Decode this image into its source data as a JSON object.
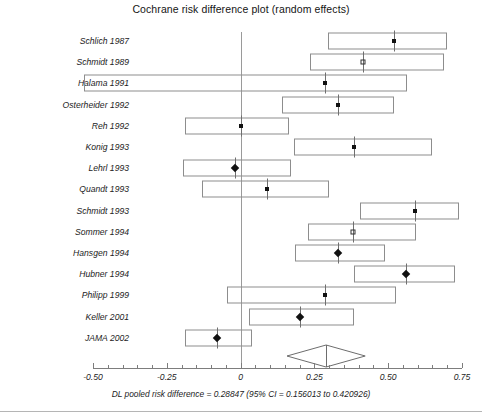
{
  "chart_data": {
    "type": "scatter",
    "subtype": "forest-plot",
    "title": "Cochrane risk difference plot (random effects)",
    "xlabel": "",
    "ylabel": "",
    "xlim": [
      -0.55,
      0.78
    ],
    "grid": false,
    "legend": "none",
    "axis": {
      "tick_labels": [
        "-0.50",
        "-0.25",
        "0",
        "0.25",
        "0.50",
        "0.75"
      ],
      "tick_values": [
        -0.5,
        -0.25,
        0,
        0.25,
        0.5,
        0.75
      ],
      "minor_tick_step": 0.05,
      "reference_line": 0
    },
    "categories": [
      "Schlich 1987",
      "Schmidt 1989",
      "Halama 1991",
      "Osterheider 1992",
      "Reh 1992",
      "Konig 1993",
      "Lehrl 1993",
      "Quandt 1993",
      "Schmidt 1993",
      "Sommer 1994",
      "Hansgen 1994",
      "Hubner 1994",
      "Philipp 1999",
      "Keller 2001",
      "JAMA 2002"
    ],
    "studies": [
      {
        "label": "Schlich 1987",
        "estimate": 0.52,
        "ci_low": 0.295,
        "ci_high": 0.7,
        "marker": "square"
      },
      {
        "label": "Schmidt 1989",
        "estimate": 0.415,
        "ci_low": 0.235,
        "ci_high": 0.69,
        "marker": "square-open"
      },
      {
        "label": "Halama 1991",
        "estimate": 0.285,
        "ci_low": -0.53,
        "ci_high": 0.565,
        "marker": "square"
      },
      {
        "label": "Osterheider 1992",
        "estimate": 0.33,
        "ci_low": 0.14,
        "ci_high": 0.52,
        "marker": "square"
      },
      {
        "label": "Reh 1992",
        "estimate": 0.0,
        "ci_low": -0.19,
        "ci_high": 0.165,
        "marker": "square"
      },
      {
        "label": "Konig 1993",
        "estimate": 0.385,
        "ci_low": 0.18,
        "ci_high": 0.65,
        "marker": "square"
      },
      {
        "label": "Lehrl 1993",
        "estimate": -0.02,
        "ci_low": -0.195,
        "ci_high": 0.17,
        "marker": "diamond"
      },
      {
        "label": "Quandt 1993",
        "estimate": 0.09,
        "ci_low": -0.13,
        "ci_high": 0.3,
        "marker": "square"
      },
      {
        "label": "Schmidt 1993",
        "estimate": 0.59,
        "ci_low": 0.405,
        "ci_high": 0.74,
        "marker": "square"
      },
      {
        "label": "Sommer 1994",
        "estimate": 0.38,
        "ci_low": 0.23,
        "ci_high": 0.595,
        "marker": "square-open"
      },
      {
        "label": "Hansgen 1994",
        "estimate": 0.33,
        "ci_low": 0.185,
        "ci_high": 0.49,
        "marker": "diamond"
      },
      {
        "label": "Hubner 1994",
        "estimate": 0.56,
        "ci_low": 0.385,
        "ci_high": 0.725,
        "marker": "diamond"
      },
      {
        "label": "Philipp 1999",
        "estimate": 0.285,
        "ci_low": -0.045,
        "ci_high": 0.525,
        "marker": "square"
      },
      {
        "label": "Keller 2001",
        "estimate": 0.2,
        "ci_low": 0.03,
        "ci_high": 0.385,
        "marker": "diamond"
      },
      {
        "label": "JAMA 2002",
        "estimate": -0.08,
        "ci_low": -0.19,
        "ci_high": 0.04,
        "marker": "diamond"
      }
    ],
    "pooled": {
      "estimate": 0.28847,
      "ci_low": 0.156013,
      "ci_high": 0.420926,
      "shape": "diamond"
    },
    "footer": "DL pooled risk difference = 0.28847  (95% CI = 0.156013 to 0.420926)"
  },
  "colors": {
    "marker": "#111111",
    "box_stroke": "#8d8d8d",
    "axis": "#7d7d7d",
    "zero_line": "#9a9a9a",
    "text": "#1c1c1c"
  }
}
